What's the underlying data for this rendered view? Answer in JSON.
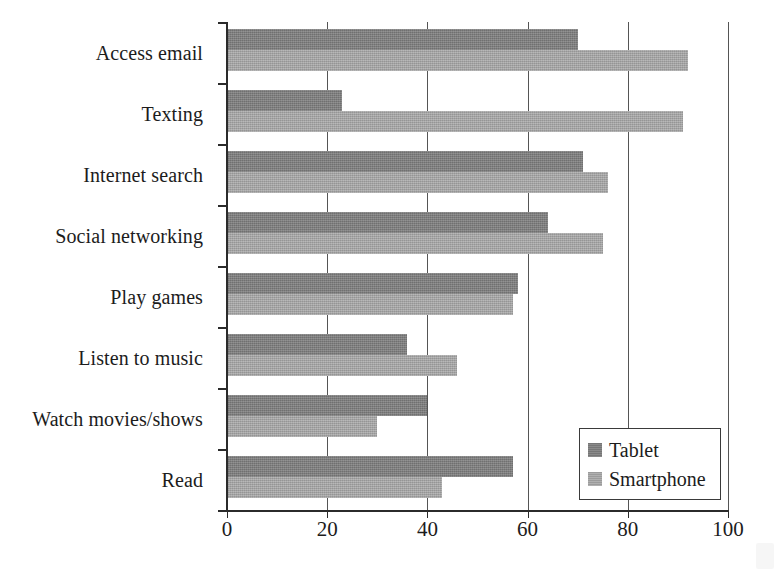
{
  "chart_data": {
    "type": "bar",
    "orientation": "horizontal",
    "title": "",
    "xlabel": "",
    "ylabel": "",
    "xlim": [
      0,
      100
    ],
    "xticks": [
      0,
      20,
      40,
      60,
      80,
      100
    ],
    "grid": true,
    "legend_position": "lower-right",
    "categories": [
      "Access email",
      "Texting",
      "Internet search",
      "Social networking",
      "Play games",
      "Listen to music",
      "Watch movies/shows",
      "Read"
    ],
    "series": [
      {
        "name": "Tablet",
        "color": "#7d7d7d",
        "values": [
          70,
          23,
          71,
          64,
          58,
          36,
          40,
          57
        ]
      },
      {
        "name": "Smartphone",
        "color": "#a3a3a3",
        "values": [
          92,
          91,
          76,
          75,
          57,
          46,
          30,
          43
        ]
      }
    ]
  },
  "legend": {
    "items": [
      {
        "label": "Tablet",
        "swatch": "tablet"
      },
      {
        "label": "Smartphone",
        "swatch": "smartphone"
      }
    ]
  },
  "axis": {
    "x_tick_labels": [
      "0",
      "20",
      "40",
      "60",
      "80",
      "100"
    ]
  }
}
